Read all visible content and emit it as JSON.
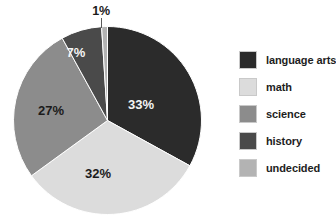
{
  "chart_data": {
    "type": "pie",
    "title": "",
    "xlabel": "",
    "ylabel": "",
    "unit": "%",
    "categories": [
      "language arts",
      "math",
      "science",
      "history",
      "undecided"
    ],
    "values": [
      33,
      32,
      27,
      7,
      1
    ],
    "labels": [
      "33%",
      "32%",
      "27%",
      "7%",
      "1%"
    ],
    "colors": [
      "#2b2b2b",
      "#dcdcdc",
      "#8c8c8c",
      "#4a4a4a",
      "#b3b3b3"
    ],
    "start_angle_deg": 0,
    "direction": "clockwise",
    "legend_position": "right",
    "grid": false,
    "slices": [
      {
        "category": "language arts",
        "value": 33,
        "label": "33%",
        "color": "#2b2b2b",
        "label_color": "light",
        "label_x": 131,
        "label_y": 83
      },
      {
        "category": "math",
        "value": 32,
        "label": "32%",
        "color": "#dcdcdc",
        "label_color": "dark",
        "label_x": 88,
        "label_y": 152
      },
      {
        "category": "science",
        "value": 27,
        "label": "27%",
        "color": "#8c8c8c",
        "label_color": "dark",
        "label_x": 41,
        "label_y": 89
      },
      {
        "category": "history",
        "value": 7,
        "label": "7%",
        "color": "#4a4a4a",
        "label_color": "light",
        "label_x": 66,
        "label_y": 31
      },
      {
        "category": "undecided",
        "value": 1,
        "label": "1%",
        "color": "#b3b3b3",
        "label_color": "dark",
        "label_x": 92,
        "label_y": 8
      }
    ]
  },
  "callout": {
    "undecided_label": "1%"
  },
  "legend": {
    "items": [
      {
        "label": "language arts",
        "color": "#2b2b2b"
      },
      {
        "label": "math",
        "color": "#dcdcdc"
      },
      {
        "label": "science",
        "color": "#8c8c8c"
      },
      {
        "label": "history",
        "color": "#4a4a4a"
      },
      {
        "label": "undecided",
        "color": "#b3b3b3"
      }
    ]
  }
}
